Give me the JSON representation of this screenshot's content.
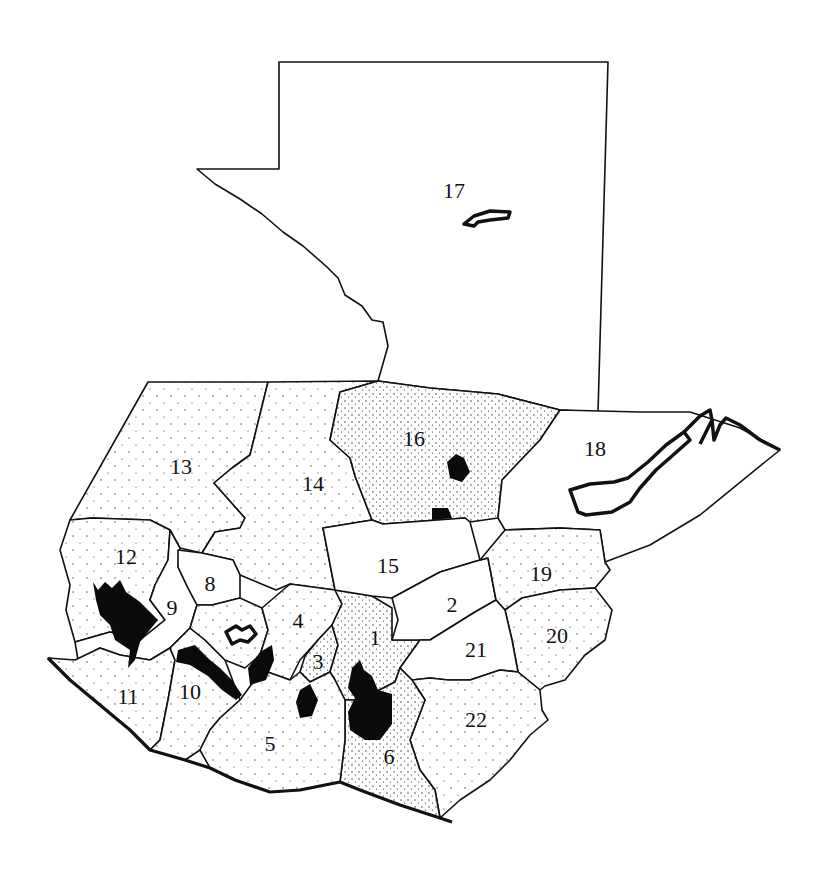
{
  "map": {
    "subject": "Guatemala departments",
    "style": "black-and-white outline map with stippled density shading",
    "colors": {
      "outline": "#111111",
      "fill": "#ffffff",
      "high_density": "#0a0a0a",
      "stipple": "#333333"
    },
    "departments": [
      {
        "id": "1",
        "label": "1",
        "x": 375,
        "y": 638
      },
      {
        "id": "2",
        "label": "2",
        "x": 452,
        "y": 605
      },
      {
        "id": "3",
        "label": "3",
        "x": 318,
        "y": 662
      },
      {
        "id": "4",
        "label": "4",
        "x": 298,
        "y": 621
      },
      {
        "id": "5",
        "label": "5",
        "x": 270,
        "y": 744
      },
      {
        "id": "6",
        "label": "6",
        "x": 389,
        "y": 757
      },
      {
        "id": "8",
        "label": "8",
        "x": 210,
        "y": 584
      },
      {
        "id": "9",
        "label": "9",
        "x": 172,
        "y": 608
      },
      {
        "id": "10",
        "label": "10",
        "x": 190,
        "y": 692
      },
      {
        "id": "11",
        "label": "11",
        "x": 128,
        "y": 697
      },
      {
        "id": "12",
        "label": "12",
        "x": 126,
        "y": 557
      },
      {
        "id": "13",
        "label": "13",
        "x": 181,
        "y": 467
      },
      {
        "id": "14",
        "label": "14",
        "x": 313,
        "y": 484
      },
      {
        "id": "15",
        "label": "15",
        "x": 388,
        "y": 566
      },
      {
        "id": "16",
        "label": "16",
        "x": 414,
        "y": 439
      },
      {
        "id": "17",
        "label": "17",
        "x": 454,
        "y": 191
      },
      {
        "id": "18",
        "label": "18",
        "x": 595,
        "y": 449
      },
      {
        "id": "19",
        "label": "19",
        "x": 541,
        "y": 574
      },
      {
        "id": "20",
        "label": "20",
        "x": 557,
        "y": 636
      },
      {
        "id": "21",
        "label": "21",
        "x": 476,
        "y": 650
      },
      {
        "id": "22",
        "label": "22",
        "x": 476,
        "y": 720
      }
    ]
  }
}
